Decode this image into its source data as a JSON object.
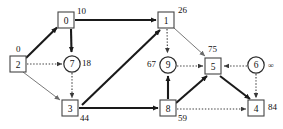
{
  "diagram": {
    "node_shapes": {
      "square": "square",
      "circle": "circle"
    },
    "nodes": [
      {
        "id": "n0",
        "label": "0",
        "shape": "square",
        "cx": 66,
        "cy": 20,
        "dist": "10",
        "dist_pos": "top-right"
      },
      {
        "id": "n1",
        "label": "1",
        "shape": "square",
        "cx": 166,
        "cy": 20,
        "dist": "26",
        "dist_pos": "top-right"
      },
      {
        "id": "n2",
        "label": "2",
        "shape": "square",
        "cx": 18,
        "cy": 64,
        "dist": "0",
        "dist_pos": "top-right"
      },
      {
        "id": "n7",
        "label": "7",
        "shape": "circle",
        "cx": 72,
        "cy": 64,
        "dist": "18",
        "dist_pos": "right"
      },
      {
        "id": "n3",
        "label": "3",
        "shape": "square",
        "cx": 70,
        "cy": 108,
        "dist": "44",
        "dist_pos": "bottom-right"
      },
      {
        "id": "n9",
        "label": "9",
        "shape": "circle",
        "cx": 168,
        "cy": 65,
        "dist": "67",
        "dist_pos": "left"
      },
      {
        "id": "n5",
        "label": "5",
        "shape": "square",
        "cx": 213,
        "cy": 66,
        "dist": "75",
        "dist_pos": "top-right"
      },
      {
        "id": "n6",
        "label": "6",
        "shape": "circle",
        "cx": 256,
        "cy": 65,
        "dist": "∞",
        "dist_pos": "right"
      },
      {
        "id": "n8",
        "label": "8",
        "shape": "square",
        "cx": 168,
        "cy": 108,
        "dist": "59",
        "dist_pos": "bottom-right"
      },
      {
        "id": "n4",
        "label": "4",
        "shape": "square",
        "cx": 256,
        "cy": 108,
        "dist": "84",
        "dist_pos": "right"
      }
    ],
    "edges": [
      {
        "from": "n2",
        "to": "n0",
        "style": "thick"
      },
      {
        "from": "n2",
        "to": "n7",
        "style": "dotted"
      },
      {
        "from": "n2",
        "to": "n3",
        "style": "thin"
      },
      {
        "from": "n0",
        "to": "n1",
        "style": "thick"
      },
      {
        "from": "n0",
        "to": "n7",
        "style": "thick"
      },
      {
        "from": "n7",
        "to": "n3",
        "style": "dotted"
      },
      {
        "from": "n3",
        "to": "n1",
        "style": "thick"
      },
      {
        "from": "n3",
        "to": "n8",
        "style": "thick"
      },
      {
        "from": "n1",
        "to": "n9",
        "style": "dotted"
      },
      {
        "from": "n1",
        "to": "n5",
        "style": "thin"
      },
      {
        "from": "n9",
        "to": "n5",
        "style": "dotted"
      },
      {
        "from": "n8",
        "to": "n9",
        "style": "thick"
      },
      {
        "from": "n8",
        "to": "n5",
        "style": "thick"
      },
      {
        "from": "n8",
        "to": "n4",
        "style": "dotted"
      },
      {
        "from": "n5",
        "to": "n4",
        "style": "thick"
      },
      {
        "from": "n6",
        "to": "n5",
        "style": "dotted"
      },
      {
        "from": "n6",
        "to": "n4",
        "style": "dotted"
      }
    ],
    "colors": {
      "node_stroke": "#444444",
      "node_fill": "#ffffff",
      "thick_edge": "#1a1a1a",
      "thin_edge": "#6a6a6a",
      "dotted_edge": "#3a3a3a",
      "text": "#111111"
    }
  }
}
